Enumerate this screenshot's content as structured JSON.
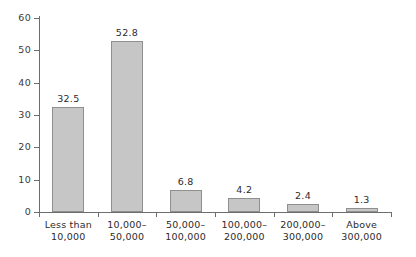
{
  "chart_data": {
    "type": "bar",
    "title": "",
    "subtitle": "",
    "xlabel": "",
    "ylabel": "",
    "ylim": [
      0,
      60
    ],
    "ytick_labels": [
      "0",
      "10",
      "20",
      "30",
      "40",
      "50",
      "60"
    ],
    "yticks": [
      0,
      10,
      20,
      30,
      40,
      50,
      60
    ],
    "grid": false,
    "legend": false,
    "categories": [
      "Less than 10,000",
      "10,000–50,000",
      "50,000–100,000",
      "100,000–200,000",
      "200,000–300,000",
      "Above 300,000"
    ],
    "category_lines": [
      [
        "Less than",
        "10,000"
      ],
      [
        "10,000–",
        "50,000"
      ],
      [
        "50,000–",
        "100,000"
      ],
      [
        "100,000–",
        "200,000"
      ],
      [
        "200,000–",
        "300,000"
      ],
      [
        "Above",
        "300,000"
      ]
    ],
    "values": [
      32.5,
      52.8,
      6.8,
      4.2,
      2.4,
      1.3
    ],
    "value_labels": [
      "32.5",
      "52.8",
      "6.8",
      "4.2",
      "2.4",
      "1.3"
    ],
    "colors": {
      "bar_fill": "#c6c6c6",
      "bar_border": "#8f8f8f",
      "axis": "#6d6d6d",
      "text": "#2b2b2b",
      "background": "#ffffff"
    }
  }
}
